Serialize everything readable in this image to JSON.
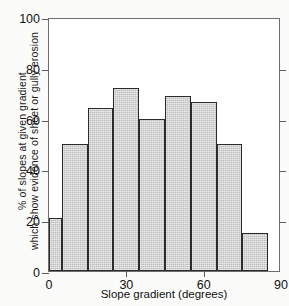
{
  "chart_data": {
    "type": "bar",
    "title": "",
    "subtitle": "",
    "xlabel": "Slope gradient (degrees)",
    "ylabel_line1": "%  of slopes at given gradient",
    "ylabel_line2": "which show evidence of sheet or gully erosion",
    "xlim": [
      0,
      90
    ],
    "ylim": [
      0,
      100
    ],
    "grid": false,
    "legend": "none",
    "bin_width": 10,
    "bin_edges": [
      0,
      5,
      15,
      25,
      35,
      45,
      55,
      65,
      75,
      85
    ],
    "categories": [
      "0-5",
      "5-15",
      "15-25",
      "25-35",
      "35-45",
      "45-55",
      "55-65",
      "65-75",
      "75-85"
    ],
    "values": [
      21,
      50,
      64,
      72,
      60,
      69,
      66.5,
      50,
      15
    ],
    "yticks": [
      0,
      20,
      40,
      60,
      80,
      100
    ],
    "ytick_labels": [
      "0",
      "20",
      "40",
      "60",
      "80",
      "100"
    ],
    "xticks": [
      0,
      30,
      60,
      90
    ],
    "xtick_labels": [
      "0",
      "30",
      "60",
      "90"
    ],
    "xminor_ticks": [
      30,
      60
    ],
    "bar_color": "#bdbdbd",
    "bar_edge_color": "#2b2b2b",
    "axis_color": "#6e6e6e"
  }
}
